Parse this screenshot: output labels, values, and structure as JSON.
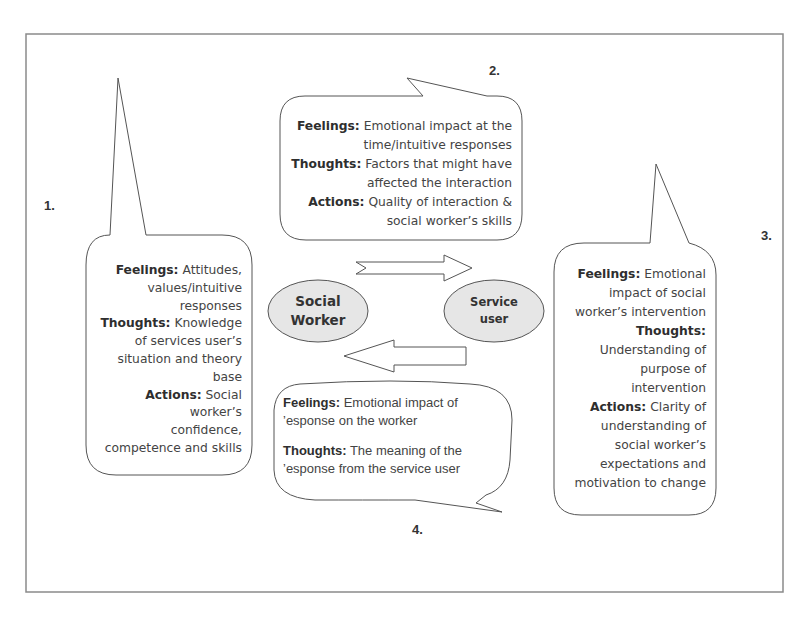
{
  "figure": {
    "frame_color": "#8a8a8a",
    "ellipse_fill": "#e6e6e6",
    "line_color": "#555555"
  },
  "nodes": {
    "social_worker": {
      "line1": "Social",
      "line2": "Worker"
    },
    "service_user": {
      "line1": "Service",
      "line2": "user"
    }
  },
  "bubbles": [
    {
      "number": "1.",
      "lines": [
        {
          "bold": "Feelings:",
          "text": " Attitudes,"
        },
        {
          "bold": "",
          "text": "values/intuitive"
        },
        {
          "bold": "",
          "text": "responses"
        },
        {
          "bold": "Thoughts:",
          "text": " Knowledge"
        },
        {
          "bold": "",
          "text": "of services user’s"
        },
        {
          "bold": "",
          "text": "situation and theory"
        },
        {
          "bold": "",
          "text": "base"
        },
        {
          "bold": "Actions:",
          "text": " Social worker’s"
        },
        {
          "bold": "",
          "text": "confidence,"
        },
        {
          "bold": "",
          "text": "competence and skills"
        }
      ]
    },
    {
      "number": "2.",
      "lines": [
        {
          "bold": "Feelings:",
          "text": " Emotional impact at the"
        },
        {
          "bold": "",
          "text": "time/intuitive responses"
        },
        {
          "bold": "Thoughts:",
          "text": " Factors that might have"
        },
        {
          "bold": "",
          "text": "affected the interaction"
        },
        {
          "bold": "Actions:",
          "text": " Quality of interaction &"
        },
        {
          "bold": "",
          "text": "social worker’s skills"
        }
      ]
    },
    {
      "number": "3.",
      "lines": [
        {
          "bold": "Feelings:",
          "text": " Emotional"
        },
        {
          "bold": "",
          "text": "impact of social"
        },
        {
          "bold": "",
          "text": "worker’s intervention"
        },
        {
          "bold": "Thoughts:",
          "text": ""
        },
        {
          "bold": "",
          "text": "Understanding of"
        },
        {
          "bold": "",
          "text": "purpose of"
        },
        {
          "bold": "",
          "text": "intervention"
        },
        {
          "bold": "Actions:",
          "text": " Clarity of"
        },
        {
          "bold": "",
          "text": "understanding of"
        },
        {
          "bold": "",
          "text": "social worker’s"
        },
        {
          "bold": "",
          "text": "expectations and"
        },
        {
          "bold": "",
          "text": "motivation to change"
        }
      ]
    },
    {
      "number": "4.",
      "lines": [
        {
          "bold": "Feelings:",
          "text": " Emotional impact of"
        },
        {
          "bold": "",
          "text": "ʼesponse on the worker"
        },
        {
          "bold": "",
          "text": ""
        },
        {
          "bold": "Thoughts:",
          "text": " The meaning of the"
        },
        {
          "bold": "",
          "text": "ʼesponse from the service user"
        }
      ]
    }
  ],
  "arrows": [
    {
      "direction": "right",
      "from": "social_worker",
      "to": "service_user"
    },
    {
      "direction": "left",
      "from": "service_user",
      "to": "social_worker"
    }
  ]
}
